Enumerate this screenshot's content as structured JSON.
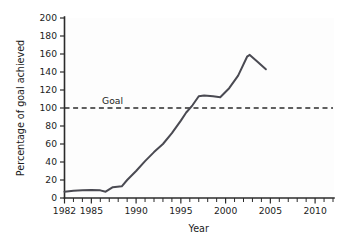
{
  "chart_data": {
    "type": "line",
    "title": "",
    "xlabel": "Year",
    "ylabel": "Percentage of goal achieved",
    "xlim": [
      1982,
      2012
    ],
    "ylim": [
      0,
      200
    ],
    "grid": false,
    "legend": null,
    "y_ticks": [
      0,
      20,
      40,
      60,
      80,
      100,
      120,
      140,
      160,
      180,
      200
    ],
    "y_ticklabels": [
      "0",
      "20",
      "40",
      "60",
      "80",
      "100",
      "120",
      "140",
      "160",
      "180",
      "200"
    ],
    "x_ticks": [
      1982,
      1985,
      1990,
      1995,
      2000,
      2005,
      2010
    ],
    "x_ticklabels": [
      "1982",
      "1985",
      "1990",
      "1995",
      "2000",
      "2005",
      "2010"
    ],
    "x_minor_ticks": [
      1982,
      1983,
      1984,
      1985,
      1986,
      1987,
      1988,
      1989,
      1990,
      1991,
      1992,
      1993,
      1994,
      1995,
      1996,
      1997,
      1998,
      1999,
      2000,
      2001,
      2002,
      2003,
      2004,
      2005,
      2006,
      2007,
      2008,
      2009,
      2010,
      2011,
      2012
    ],
    "series": [
      {
        "name": "Percentage of goal achieved",
        "color": "#4a4a52",
        "x": [
          1982,
          1983,
          1984,
          1985,
          1986,
          1986.6,
          1987.4,
          1988.4,
          1989,
          1990,
          1991,
          1992,
          1993,
          1994,
          1995,
          1995.6,
          1996.3,
          1997,
          1997.6,
          1998.6,
          1999.4,
          2000.4,
          2001.4,
          2002.4,
          2002.7,
          2003.5,
          2004.5
        ],
        "y": [
          7,
          8,
          8.5,
          9,
          8.5,
          7,
          12,
          13,
          20,
          30,
          41,
          51,
          60,
          72,
          86,
          95,
          103,
          113,
          114,
          113,
          112,
          122,
          136,
          157,
          159,
          152,
          143
        ]
      }
    ],
    "reference_lines": [
      {
        "label": "Goal",
        "value": 100,
        "orientation": "horizontal",
        "style": "dashed",
        "color": "#2b2b2b",
        "label_x": 1986.2
      }
    ],
    "colors": {
      "line": "#4a4a52",
      "axis": "#2b2b2b",
      "text": "#1c1c1c",
      "plot_background": "#fdfdfd",
      "figure_background": "#ffffff"
    }
  }
}
